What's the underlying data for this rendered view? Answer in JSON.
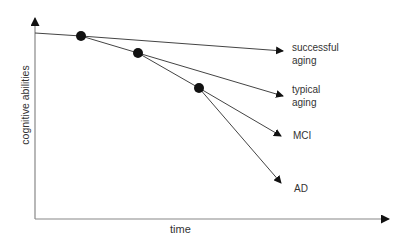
{
  "diagram": {
    "axes": {
      "x_label": "time",
      "y_label": "cognitive abilities",
      "color": "#888888"
    },
    "line_color": "#444444",
    "dot_color": "#111111",
    "trajectories": [
      {
        "label_line1": "successful",
        "label_line2": "aging",
        "branch_point": 1
      },
      {
        "label_line1": "typical",
        "label_line2": "aging",
        "branch_point": 1
      },
      {
        "label_line1": "MCI",
        "label_line2": "",
        "branch_point": 3
      },
      {
        "label_line1": "AD",
        "label_line2": "",
        "branch_point": 3
      }
    ],
    "branch_points": 3
  }
}
